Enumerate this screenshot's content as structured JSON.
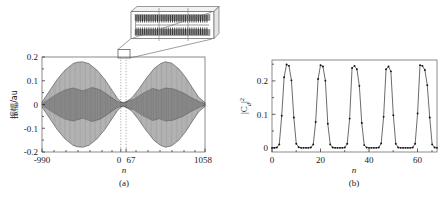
{
  "figure": {
    "panels": [
      {
        "id": "a",
        "label": "(a)",
        "ylabel": "振幅/au",
        "xlabel": "n",
        "yticks": [
          "0.2",
          "0.1",
          "0",
          "-0.1",
          "-0.2"
        ],
        "ytickvals": [
          0.2,
          0.1,
          0,
          -0.1,
          -0.2
        ],
        "xticks": [
          "-990",
          "0",
          "67",
          "1058"
        ],
        "xtickvals": [
          -990,
          0,
          67,
          1058
        ],
        "guide_lines": [
          0,
          67
        ],
        "inset": {
          "name": "zoom-inset",
          "description": "magnified oscillation detail"
        }
      },
      {
        "id": "b",
        "label": "(b)",
        "ylabel": "|Cd|2",
        "ylabel_parts": {
          "base": "|C",
          "sub": "d",
          "close": "|",
          "sup": "2"
        },
        "xlabel": "n",
        "yticks": [
          "0",
          "0.1",
          "0.2"
        ],
        "ytickvals": [
          0,
          0.1,
          0.2
        ],
        "xticks": [
          "0",
          "20",
          "40",
          "60"
        ],
        "xtickvals": [
          0,
          20,
          40,
          60
        ]
      }
    ]
  },
  "chart_data": [
    {
      "type": "line",
      "panel": "a",
      "title": "",
      "xlabel": "n",
      "ylabel": "振幅/au",
      "xlim": [
        -990,
        1058
      ],
      "ylim": [
        -0.2,
        0.2
      ],
      "grid": false,
      "legend": "none",
      "annotations": [
        "(a)",
        "inset magnifier box at n = 0 to 67"
      ],
      "description": "Two symmetric wave packets (revival structure) of a rapidly oscillating carrier; envelope peaks near +/-0.18 centred about n = -480 and n = 560, with a node (collapse) region near n = 35.",
      "series": [
        {
          "name": "amplitude envelope (upper)",
          "x": [
            -990,
            -900,
            -800,
            -700,
            -600,
            -550,
            -480,
            -400,
            -300,
            -200,
            -120,
            -40,
            0,
            35,
            70,
            140,
            220,
            320,
            420,
            500,
            560,
            640,
            730,
            820,
            900,
            980,
            1058
          ],
          "values": [
            0.01,
            0.055,
            0.105,
            0.145,
            0.172,
            0.178,
            0.18,
            0.172,
            0.145,
            0.105,
            0.065,
            0.025,
            0.012,
            0.006,
            0.012,
            0.028,
            0.062,
            0.11,
            0.152,
            0.172,
            0.18,
            0.174,
            0.15,
            0.112,
            0.07,
            0.03,
            0.008
          ]
        },
        {
          "name": "amplitude envelope (lower)",
          "x": [
            -990,
            -900,
            -800,
            -700,
            -600,
            -550,
            -480,
            -400,
            -300,
            -200,
            -120,
            -40,
            0,
            35,
            70,
            140,
            220,
            320,
            420,
            500,
            560,
            640,
            730,
            820,
            900,
            980,
            1058
          ],
          "values": [
            -0.01,
            -0.055,
            -0.105,
            -0.145,
            -0.172,
            -0.178,
            -0.18,
            -0.172,
            -0.145,
            -0.105,
            -0.065,
            -0.025,
            -0.012,
            -0.006,
            -0.012,
            -0.028,
            -0.062,
            -0.11,
            -0.152,
            -0.172,
            -0.18,
            -0.174,
            -0.15,
            -0.112,
            -0.07,
            -0.03,
            -0.008
          ]
        },
        {
          "name": "inner sub-envelope (upper)",
          "x": [
            -990,
            -800,
            -700,
            -600,
            -480,
            -360,
            -260,
            -160,
            -60,
            0,
            60,
            160,
            280,
            400,
            480,
            560,
            660,
            780,
            880,
            1000,
            1058
          ],
          "values": [
            0.004,
            0.045,
            0.062,
            0.07,
            0.058,
            0.072,
            0.062,
            0.04,
            0.016,
            0.008,
            0.012,
            0.022,
            0.048,
            0.068,
            0.06,
            0.07,
            0.066,
            0.05,
            0.03,
            0.01,
            0.004
          ]
        },
        {
          "name": "inner sub-envelope (lower)",
          "x": [
            -990,
            -800,
            -700,
            -600,
            -480,
            -360,
            -260,
            -160,
            -60,
            0,
            60,
            160,
            280,
            400,
            480,
            560,
            660,
            780,
            880,
            1000,
            1058
          ],
          "values": [
            -0.004,
            -0.045,
            -0.062,
            -0.07,
            -0.058,
            -0.072,
            -0.062,
            -0.04,
            -0.016,
            -0.008,
            -0.012,
            -0.022,
            -0.048,
            -0.068,
            -0.06,
            -0.07,
            -0.066,
            -0.05,
            -0.03,
            -0.01,
            -0.004
          ]
        }
      ],
      "carrier": {
        "period_n": 21,
        "note": "dense fast oscillation filling the envelope"
      }
    },
    {
      "type": "line",
      "panel": "b",
      "title": "",
      "xlabel": "n",
      "ylabel": "|Cd|2",
      "xlim": [
        0,
        68
      ],
      "ylim": [
        -0.012,
        0.255
      ],
      "grid": false,
      "legend": "none",
      "markers": "dots",
      "annotations": [
        "(b)"
      ],
      "description": "Periodic revival peaks of |Cd|^2 reaching ~0.24, with period ~13.7 in n and near-zero plateau between peaks.",
      "peaks_n": [
        6,
        20,
        33,
        47,
        61
      ],
      "peak_value": 0.24,
      "period_n": 13.7,
      "x": [
        0,
        1,
        2,
        3,
        4,
        5,
        6,
        7,
        8,
        9,
        10,
        11,
        12,
        13,
        14,
        15,
        16,
        17,
        18,
        19,
        20,
        21,
        22,
        23,
        24,
        25,
        26,
        27,
        28,
        29,
        30,
        31,
        32,
        33,
        34,
        35,
        36,
        37,
        38,
        39,
        40,
        41,
        42,
        43,
        44,
        45,
        46,
        47,
        48,
        49,
        50,
        51,
        52,
        53,
        54,
        55,
        56,
        57,
        58,
        59,
        60,
        61,
        62,
        63,
        64,
        65,
        66,
        67,
        68
      ],
      "values": [
        0.0,
        0.0,
        0.001,
        0.01,
        0.093,
        0.205,
        0.242,
        0.238,
        0.196,
        0.088,
        0.012,
        0.002,
        0.0,
        0.0,
        0.0,
        0.0,
        0.001,
        0.01,
        0.075,
        0.2,
        0.24,
        0.236,
        0.195,
        0.07,
        0.01,
        0.001,
        0.0,
        0.0,
        0.0,
        0.0,
        0.001,
        0.012,
        0.085,
        0.232,
        0.238,
        0.228,
        0.18,
        0.072,
        0.008,
        0.001,
        0.0,
        0.0,
        0.0,
        0.0,
        0.001,
        0.013,
        0.09,
        0.228,
        0.236,
        0.222,
        0.095,
        0.012,
        0.001,
        0.0,
        0.0,
        0.0,
        0.0,
        0.0,
        0.001,
        0.012,
        0.1,
        0.24,
        0.238,
        0.226,
        0.182,
        0.088,
        0.01,
        0.001,
        0.0
      ]
    }
  ]
}
